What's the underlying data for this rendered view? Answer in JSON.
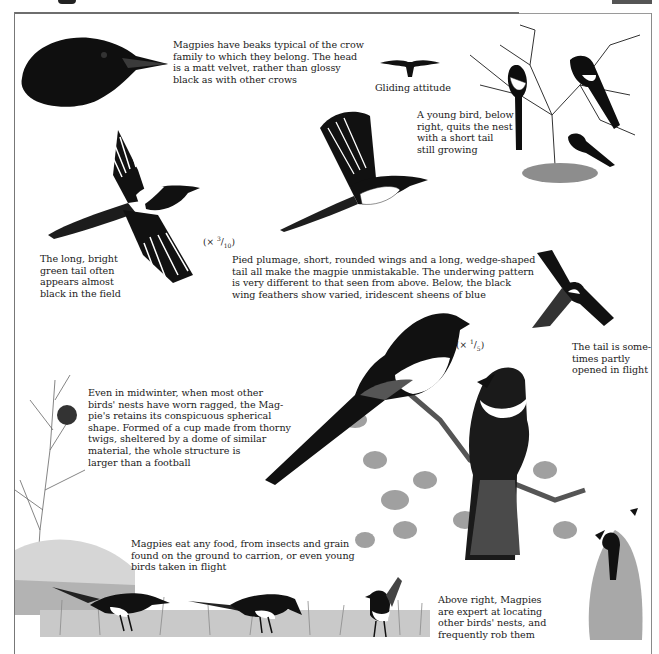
{
  "page": {
    "header_glyph": "",
    "frame_color": "#6e6e6e"
  },
  "captions": {
    "head": "Magpies have beaks typical of the crow\nfamily to which they belong. The head\nis a matt velvet, rather than glossy\nblack as with other crows",
    "gliding": "Gliding attitude",
    "young_bird": "A young bird, below\nright, quits the nest\nwith a short tail\nstill growing",
    "tail": "The long, bright\ngreen tail often\nappears almost\nblack in the field",
    "plumage": "Pied plumage, short, rounded wings and a long, wedge-shaped\ntail all make the magpie unmistakable. The underwing pattern\nis very different to that seen from above. Below, the black\nwing feathers show varied, iridescent sheens of blue",
    "tail_flight": "The tail is some-\ntimes partly\nopened in flight",
    "nest": "Even in midwinter, when most other\nbirds' nests have worn ragged, the Mag-\npie's retains its conspicuous spherical\nshape. Formed of a cup made from thorny\ntwigs, sheltered by a dome of similar\nmaterial, the whole structure is\nlarger than a football",
    "food": "Magpies eat any food, from insects and grain\nfound on the ground to carrion, or even young\nbirds taken in flight",
    "robbing": "Above right, Magpies\nare expert at locating\nother birds' nests, and\nfrequently rob them"
  },
  "scales": {
    "flying": {
      "prefix": "(× ",
      "num": "3",
      "den": "10",
      "suffix": ")"
    },
    "perched": {
      "prefix": "(× ",
      "num": "1",
      "den": "5",
      "suffix": ")"
    }
  },
  "illustrations": [
    {
      "id": "crow-head",
      "label": "Magpie head profile"
    },
    {
      "id": "gliding-silhouette",
      "label": "Gliding attitude silhouette"
    },
    {
      "id": "magpies-in-tree",
      "label": "Three magpies in bare tree with nest"
    },
    {
      "id": "flying-magpie-upper",
      "label": "Magpie in flight seen from above"
    },
    {
      "id": "flying-magpie-under",
      "label": "Magpie in flight seen from below"
    },
    {
      "id": "magpie-tail-open",
      "label": "Magpie with tail opened in flight"
    },
    {
      "id": "nest-tree",
      "label": "Tree with spherical nest"
    },
    {
      "id": "perched-magpies",
      "label": "Two magpies perched on branch"
    },
    {
      "id": "feeding-magpies",
      "label": "Three magpies feeding in grass"
    },
    {
      "id": "nest-robbing",
      "label": "Magpie robbing nest in bush"
    }
  ],
  "colors": {
    "ink": "#111111",
    "white_patch": "#ffffff",
    "foliage": "#9a9a9a",
    "grass": "#8c8c8c"
  }
}
